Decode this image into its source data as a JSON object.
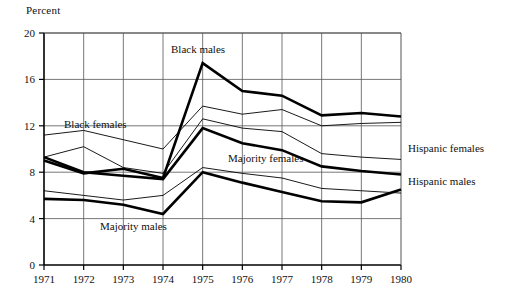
{
  "chart_data": {
    "type": "line",
    "title": "",
    "ylabel": "Percent",
    "xlabel": "",
    "grid": true,
    "legend_position": "inline-annotations",
    "ylim": [
      0,
      20
    ],
    "yticks": [
      0,
      4,
      8,
      12,
      16,
      20
    ],
    "ytick_labels": [
      "0",
      "4",
      "8",
      "12",
      "16",
      "20"
    ],
    "categories": [
      1971,
      1972,
      1973,
      1974,
      1975,
      1976,
      1977,
      1978,
      1979,
      1980
    ],
    "xtick_labels": [
      "1971",
      "1972",
      "1973",
      "1974",
      "1975",
      "1976",
      "1977",
      "1978",
      "1979",
      "1980"
    ],
    "series": [
      {
        "name": "Black males",
        "style": "thick",
        "values": [
          9.0,
          7.9,
          8.3,
          7.5,
          17.4,
          15.0,
          14.6,
          12.9,
          13.1,
          12.8
        ]
      },
      {
        "name": "Black females",
        "style": "thin",
        "values": [
          11.2,
          11.6,
          10.8,
          10.0,
          13.7,
          13.0,
          13.4,
          12.0,
          12.2,
          12.3
        ]
      },
      {
        "name": "Majority females",
        "style": "thin",
        "values": [
          6.4,
          6.0,
          5.6,
          6.0,
          8.4,
          7.9,
          7.5,
          6.6,
          6.4,
          6.2
        ]
      },
      {
        "name": "Majority males",
        "style": "thick",
        "values": [
          5.7,
          5.6,
          5.2,
          4.4,
          8.0,
          7.1,
          6.3,
          5.5,
          5.4,
          6.5
        ]
      },
      {
        "name": "Hispanic females",
        "style": "thin",
        "values": [
          9.3,
          10.2,
          8.4,
          7.9,
          12.6,
          11.8,
          11.5,
          9.6,
          9.3,
          9.1
        ]
      },
      {
        "name": "Hispanic males",
        "style": "thick",
        "values": [
          9.3,
          8.0,
          7.7,
          7.4,
          11.8,
          10.5,
          9.9,
          8.5,
          8.1,
          7.8
        ]
      }
    ],
    "annotations": [
      {
        "text": "Black males",
        "x": 171,
        "y": 53,
        "anchor": "start"
      },
      {
        "text": "Black females",
        "x": 64,
        "y": 128,
        "anchor": "start"
      },
      {
        "text": "Majority females",
        "x": 228,
        "y": 162,
        "anchor": "start"
      },
      {
        "text": "Majority males",
        "x": 100,
        "y": 230,
        "anchor": "start"
      },
      {
        "text": "Hispanic females",
        "x": 408,
        "y": 152,
        "anchor": "start"
      },
      {
        "text": "Hispanic males",
        "x": 408,
        "y": 185,
        "anchor": "start"
      }
    ],
    "colors": {
      "line": "#000000",
      "grid": "#555555",
      "axis": "#000000",
      "background": "#ffffff"
    }
  },
  "labels": {
    "percent": "Percent"
  }
}
